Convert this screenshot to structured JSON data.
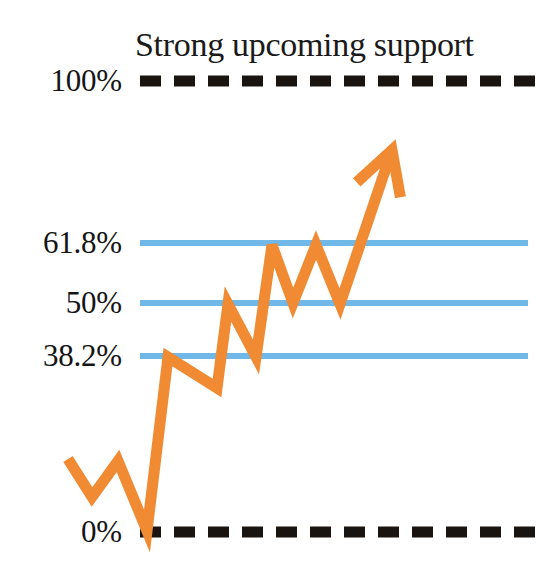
{
  "chart_data": {
    "type": "line",
    "title": "Strong upcoming support",
    "subtitle": "",
    "xlabel": "",
    "ylabel": "",
    "grid": true,
    "legend_position": "none",
    "ylim": [
      0,
      100
    ],
    "annotation": "Strong upcoming support",
    "levels": [
      {
        "label": "100%",
        "value": 100,
        "y": 81,
        "style": "dashed",
        "color": "#1a1410"
      },
      {
        "label": "61.8%",
        "value": 61.8,
        "y": 243,
        "style": "solid",
        "color": "#6FB8E8"
      },
      {
        "label": "50%",
        "value": 50,
        "y": 303,
        "style": "solid",
        "color": "#6FB8E8"
      },
      {
        "label": "38.2%",
        "value": 38.2,
        "y": 356,
        "style": "solid",
        "color": "#6FB8E8"
      },
      {
        "label": "0%",
        "value": 0,
        "y": 532,
        "style": "dashed",
        "color": "#1a1410"
      }
    ],
    "series": [
      {
        "name": "price-path",
        "color": "#F08A33",
        "points": [
          [
            68,
            459
          ],
          [
            92,
            497
          ],
          [
            118,
            461
          ],
          [
            147,
            531
          ],
          [
            168,
            357
          ],
          [
            217,
            388
          ],
          [
            228,
            304
          ],
          [
            256,
            357
          ],
          [
            272,
            245
          ],
          [
            293,
            303
          ],
          [
            316,
            245
          ],
          [
            340,
            304
          ],
          [
            392,
            150
          ]
        ],
        "arrow_head": true
      }
    ],
    "colors": {
      "line": "#F08A33",
      "fib_level": "#6FB8E8",
      "boundary": "#1a1410",
      "text": "#151515",
      "background": "#ffffff"
    },
    "plot_area": {
      "x0": 140,
      "x1": 537,
      "y_top": 81,
      "y_bottom": 532
    }
  },
  "labels": {
    "level_100": "100%",
    "level_618": "61.8%",
    "level_50": "50%",
    "level_382": "38.2%",
    "level_0": "0%"
  },
  "title": {
    "text": "Strong upcoming support"
  }
}
